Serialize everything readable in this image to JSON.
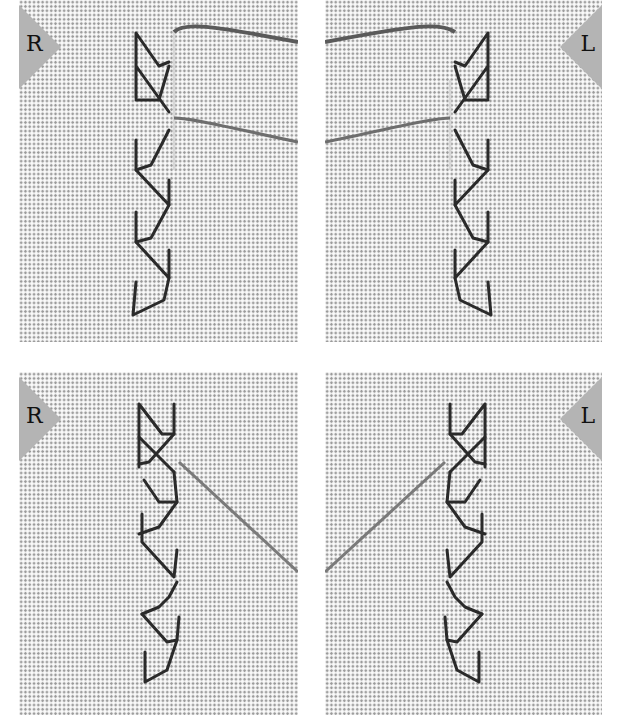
{
  "figure": {
    "panels": [
      {
        "id": "top-left",
        "marker": "R",
        "step": "needle-vertical-thread-horizontal"
      },
      {
        "id": "top-right",
        "marker": "L",
        "step": "needle-vertical-thread-horizontal"
      },
      {
        "id": "bottom-left",
        "marker": "R",
        "step": "thread-pulled-diagonal"
      },
      {
        "id": "bottom-right",
        "marker": "L",
        "step": "thread-pulled-diagonal"
      }
    ],
    "colors": {
      "fabric": "#ececec",
      "fabric_dots": "#9a9a9a",
      "marker_fill": "#b4b4b4",
      "stitch": "#2a2a2a",
      "working_thread": "#6e6e6e",
      "needle": "#d8d8d8"
    }
  }
}
